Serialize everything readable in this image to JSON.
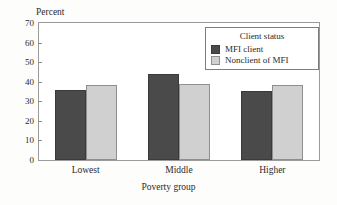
{
  "chart_data": {
    "type": "bar",
    "title": "",
    "xlabel": "Poverty group",
    "ylabel": "Percent",
    "categories": [
      "Lowest",
      "Middle",
      "Higher"
    ],
    "series": [
      {
        "name": "MFI client",
        "color": "#4a4a4a",
        "values": [
          36,
          44,
          35.5
        ]
      },
      {
        "name": "Nonclient of MFI",
        "color": "#d0d0d0",
        "values": [
          38.5,
          38.7,
          38.5
        ]
      }
    ],
    "ylim": [
      0,
      70
    ],
    "ytick_step": 10,
    "yticks": [
      0,
      10,
      20,
      30,
      40,
      50,
      60,
      70
    ],
    "ytick_labels": [
      "0",
      "10",
      "20",
      "30",
      "40",
      "50",
      "60",
      "70"
    ],
    "grid": false,
    "legend_title": "Client status",
    "legend_position": "top-right-inside",
    "frame": true
  },
  "axes": {
    "y_title": "Percent",
    "x_title": "Poverty group"
  },
  "legend": {
    "title": "Client status",
    "entries": [
      {
        "label": "MFI client",
        "color": "#4a4a4a"
      },
      {
        "label": "Nonclient of MFI",
        "color": "#d0d0d0"
      }
    ]
  }
}
